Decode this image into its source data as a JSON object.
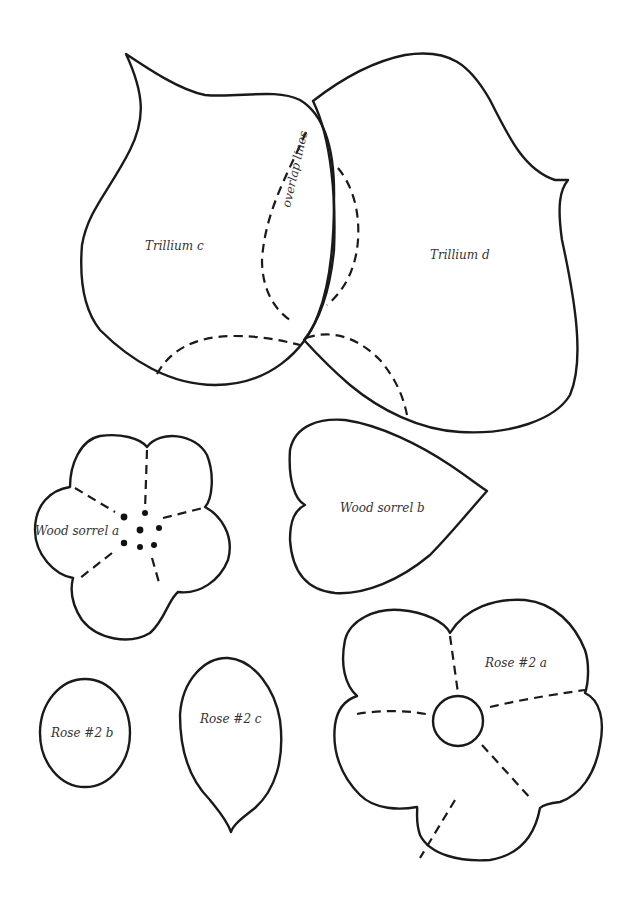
{
  "page": {
    "background": "#ffffff",
    "line_color": "#1a1a1a"
  },
  "pieces": {
    "trillium_c": {
      "label": "Trillium c"
    },
    "trillium_d": {
      "label": "Trillium d"
    },
    "overlap": {
      "label": "overlap lines"
    },
    "wood_sorrel_a": {
      "label": "Wood sorrel a"
    },
    "wood_sorrel_b": {
      "label": "Wood sorrel b"
    },
    "rose2_a": {
      "label": "Rose #2 a"
    },
    "rose2_b": {
      "label": "Rose #2 b"
    },
    "rose2_c": {
      "label": "Rose #2 c"
    }
  }
}
